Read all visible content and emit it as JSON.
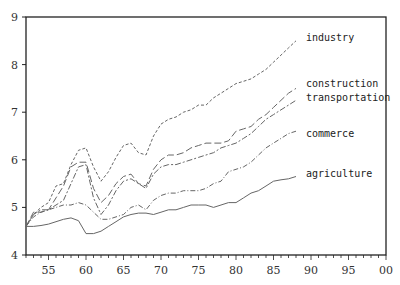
{
  "chart_data": {
    "type": "line",
    "title": "",
    "xlabel": "",
    "ylabel": "",
    "xlim": [
      52,
      100
    ],
    "ylim": [
      4,
      9
    ],
    "grid": false,
    "legend_position": "inline-right",
    "x_ticks": [
      55,
      60,
      65,
      70,
      75,
      80,
      85,
      90,
      95,
      100
    ],
    "x_tick_labels": [
      "55",
      "60",
      "65",
      "70",
      "75",
      "80",
      "85",
      "90",
      "95",
      "00"
    ],
    "y_ticks": [
      4,
      5,
      6,
      7,
      8,
      9
    ],
    "y_tick_labels": [
      "4",
      "5",
      "6",
      "7",
      "8",
      "9"
    ],
    "x": [
      52,
      53,
      54,
      55,
      56,
      57,
      58,
      59,
      60,
      61,
      62,
      63,
      64,
      65,
      66,
      67,
      68,
      69,
      70,
      71,
      72,
      73,
      74,
      75,
      76,
      77,
      78,
      79,
      80,
      81,
      82,
      83,
      84,
      85,
      86,
      87,
      88
    ],
    "series": [
      {
        "name": "industry",
        "style": "dashed-fine",
        "label_y": 8.55,
        "values": [
          4.6,
          4.85,
          5.0,
          5.1,
          5.45,
          5.5,
          5.9,
          6.2,
          6.25,
          5.85,
          5.55,
          5.75,
          6.05,
          6.3,
          6.35,
          6.15,
          6.1,
          6.5,
          6.75,
          6.85,
          6.9,
          7.0,
          7.05,
          7.15,
          7.15,
          7.3,
          7.4,
          7.5,
          7.6,
          7.65,
          7.7,
          7.8,
          7.9,
          8.05,
          8.2,
          8.35,
          8.5
        ]
      },
      {
        "name": "construction",
        "style": "long-dash",
        "label_y": 7.6,
        "values": [
          4.6,
          4.9,
          4.9,
          4.95,
          5.2,
          5.45,
          5.85,
          5.95,
          5.95,
          5.4,
          5.1,
          5.25,
          5.5,
          5.65,
          5.7,
          5.5,
          5.45,
          5.8,
          6.0,
          6.1,
          6.1,
          6.15,
          6.25,
          6.3,
          6.35,
          6.35,
          6.35,
          6.4,
          6.6,
          6.65,
          6.7,
          6.85,
          6.95,
          7.1,
          7.25,
          7.4,
          7.5
        ]
      },
      {
        "name": "transportation",
        "style": "dash-dot",
        "label_y": 7.3,
        "values": [
          4.6,
          4.85,
          4.95,
          4.95,
          5.05,
          5.15,
          5.5,
          5.85,
          5.9,
          5.2,
          4.85,
          5.05,
          5.35,
          5.55,
          5.6,
          5.5,
          5.4,
          5.7,
          5.85,
          5.9,
          5.9,
          5.95,
          6.0,
          6.05,
          6.1,
          6.15,
          6.25,
          6.3,
          6.35,
          6.45,
          6.55,
          6.7,
          6.85,
          6.95,
          7.05,
          7.15,
          7.25
        ]
      },
      {
        "name": "commerce",
        "style": "dash-dot-fine",
        "label_y": 6.55,
        "values": [
          4.6,
          4.8,
          4.9,
          4.95,
          5.0,
          5.05,
          5.05,
          5.1,
          5.05,
          4.9,
          4.75,
          4.75,
          4.8,
          4.85,
          5.0,
          5.05,
          4.95,
          5.15,
          5.25,
          5.3,
          5.3,
          5.35,
          5.35,
          5.35,
          5.4,
          5.5,
          5.55,
          5.75,
          5.8,
          5.85,
          5.95,
          6.1,
          6.25,
          6.35,
          6.45,
          6.55,
          6.6
        ]
      },
      {
        "name": "agriculture",
        "style": "solid",
        "label_y": 5.7,
        "values": [
          4.6,
          4.6,
          4.62,
          4.65,
          4.7,
          4.75,
          4.78,
          4.72,
          4.45,
          4.45,
          4.5,
          4.6,
          4.7,
          4.8,
          4.85,
          4.88,
          4.88,
          4.85,
          4.9,
          4.95,
          4.95,
          5.0,
          5.05,
          5.05,
          5.05,
          5.0,
          5.05,
          5.1,
          5.1,
          5.2,
          5.3,
          5.35,
          5.45,
          5.55,
          5.58,
          5.6,
          5.65
        ]
      }
    ]
  },
  "colors": {
    "axis": "#222222",
    "series": "#666666",
    "text": "#333333",
    "background": "#ffffff"
  }
}
